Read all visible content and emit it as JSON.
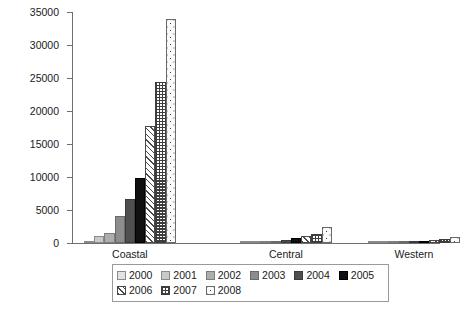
{
  "chart_data": {
    "type": "bar",
    "title": "",
    "xlabel": "",
    "ylabel": "Patent counts",
    "ylim": [
      0,
      35000
    ],
    "ytick_values": [
      0,
      5000,
      10000,
      15000,
      20000,
      25000,
      30000,
      35000
    ],
    "ytick_labels": [
      "0",
      "5000",
      "10000",
      "15000",
      "20000",
      "25000",
      "30000",
      "35000"
    ],
    "grid": false,
    "legend_position": "bottom",
    "categories": [
      "Coastal",
      "Central",
      "Western"
    ],
    "series": [
      {
        "name": "2000",
        "values": [
          320,
          60,
          30
        ]
      },
      {
        "name": "2001",
        "values": [
          1050,
          110,
          45
        ]
      },
      {
        "name": "2002",
        "values": [
          1500,
          150,
          70
        ]
      },
      {
        "name": "2003",
        "values": [
          4050,
          330,
          130
        ]
      },
      {
        "name": "2004",
        "values": [
          6600,
          520,
          210
        ]
      },
      {
        "name": "2005",
        "values": [
          9900,
          800,
          330
        ]
      },
      {
        "name": "2006",
        "values": [
          17700,
          1000,
          420
        ]
      },
      {
        "name": "2007",
        "values": [
          24400,
          1400,
          620
        ]
      },
      {
        "name": "2008",
        "values": [
          33900,
          2400,
          900
        ]
      }
    ]
  },
  "legend": {
    "rows": [
      [
        "2000",
        "2001",
        "2002",
        "2003",
        "2004",
        "2005"
      ],
      [
        "2006",
        "2007",
        "2008"
      ]
    ]
  }
}
